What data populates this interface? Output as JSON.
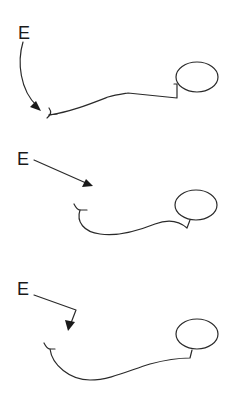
{
  "diagram": {
    "type": "three-panel schematic of a neuron (dendrite-terminal + axon + cell body) with stimulus arrows",
    "panels": [
      {
        "id": "panel-1",
        "label": "E",
        "arrow_style": "curved arrow pointing down to terminal",
        "colors": {
          "stroke": "#2a2a2a",
          "background": "#ffffff"
        }
      },
      {
        "id": "panel-2",
        "label": "E",
        "arrow_style": "straight diagonal arrow",
        "colors": {
          "stroke": "#2a2a2a",
          "background": "#ffffff"
        }
      },
      {
        "id": "panel-3",
        "label": "E",
        "arrow_style": "bent (elbow) arrow",
        "colors": {
          "stroke": "#2a2a2a",
          "background": "#ffffff"
        }
      }
    ]
  }
}
